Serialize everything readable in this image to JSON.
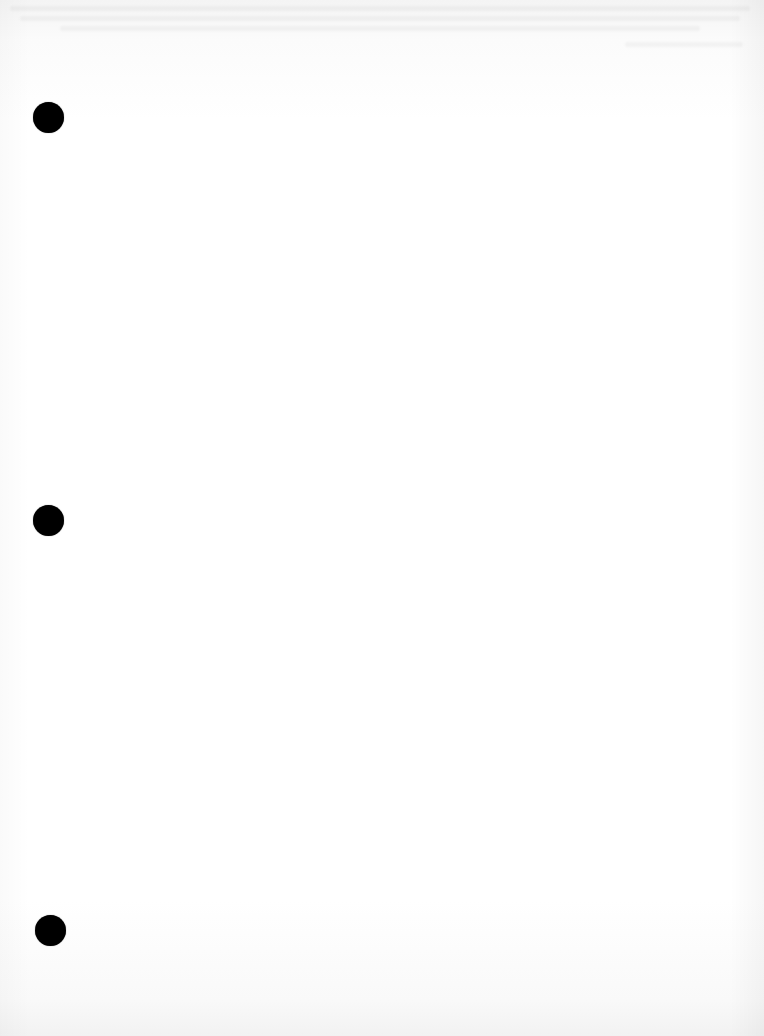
{
  "document": {
    "type": "scanned-blank-page",
    "background_color": "#ffffff",
    "text_content": "",
    "punch_holes": [
      {
        "cx": 48,
        "cy": 117,
        "diameter": 31,
        "color": "#000000"
      },
      {
        "cx": 48,
        "cy": 520,
        "diameter": 31,
        "color": "#000000"
      },
      {
        "cx": 50,
        "cy": 930,
        "diameter": 31,
        "color": "#000000"
      }
    ],
    "show_through": {
      "region": "top-edge",
      "legible": false
    }
  }
}
